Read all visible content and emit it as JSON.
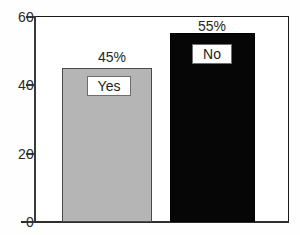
{
  "chart_data": {
    "type": "bar",
    "title": "",
    "subtitle": "",
    "xlabel": "",
    "ylabel": "",
    "categories": [
      "Yes",
      "No"
    ],
    "values": [
      45,
      55
    ],
    "data_labels": [
      "45%",
      "55%"
    ],
    "series": [
      {
        "name": "Response",
        "values": [
          45,
          55
        ]
      }
    ],
    "ylim": [
      0,
      60
    ],
    "yticks": [
      0,
      20,
      40,
      60
    ],
    "ytick_labels": [
      "0",
      "20",
      "40",
      "60"
    ],
    "xticks": [],
    "xtick_labels": [],
    "grid": false,
    "legend": false,
    "legend_position": "none",
    "bar_colors": [
      "#b5b5b5",
      "#060606"
    ],
    "frame_color": "#1a1a1a",
    "axis_color": "#3a3a3a",
    "label_text_color": "#262626",
    "inset_labels": [
      "Yes",
      "No"
    ]
  },
  "artifact": {
    "top_right_fragment": ""
  }
}
